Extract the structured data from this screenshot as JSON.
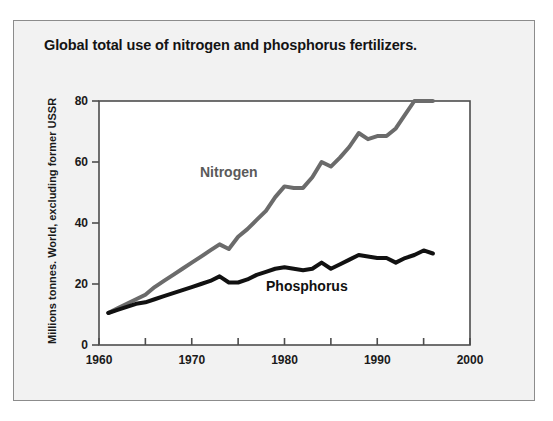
{
  "figure": {
    "title": "Global total use of nitrogen and phosphorus fertilizers.",
    "background_color": "#f2f2f2",
    "border_color": "#8c8c8c",
    "plot_background_color": "#ffffff"
  },
  "chart_data": {
    "type": "line",
    "title": "Global total use of nitrogen and phosphorus fertilizers.",
    "xlabel": "",
    "ylabel": "Millions tonnes. World, excluding former USSR",
    "xlim": [
      1960,
      2000
    ],
    "ylim": [
      0,
      80
    ],
    "xticks": [
      1960,
      1970,
      1980,
      1990,
      2000
    ],
    "xticklabels": [
      "1960",
      "1970",
      "1980",
      "1990",
      "2000"
    ],
    "xminorticks": [
      1965,
      1975,
      1985,
      1995
    ],
    "yticks": [
      0,
      20,
      40,
      60,
      80
    ],
    "yticklabels": [
      "0",
      "20",
      "40",
      "60",
      "80"
    ],
    "grid": false,
    "legend": "inline-annotations",
    "x": [
      1961,
      1962,
      1963,
      1964,
      1965,
      1966,
      1967,
      1968,
      1969,
      1970,
      1971,
      1972,
      1973,
      1974,
      1975,
      1976,
      1977,
      1978,
      1979,
      1980,
      1981,
      1982,
      1983,
      1984,
      1985,
      1986,
      1987,
      1988,
      1989,
      1990,
      1991,
      1992,
      1993,
      1994,
      1995,
      1996
    ],
    "series": [
      {
        "name": "Nitrogen",
        "color": "#6b6b6b",
        "label_color": "#5a5a5a",
        "line_width": 4,
        "values": [
          10.5,
          12.0,
          13.5,
          15.0,
          16.5,
          19.0,
          21.0,
          23.0,
          25.0,
          27.0,
          29.0,
          31.0,
          33.0,
          31.5,
          35.5,
          38.0,
          41.0,
          44.0,
          48.5,
          52.0,
          51.5,
          51.5,
          55.0,
          60.0,
          58.5,
          61.5,
          65.0,
          69.5,
          67.5,
          68.5,
          68.5,
          71.0,
          75.5,
          80.0,
          80.0,
          80.0
        ]
      },
      {
        "name": "Phosphorus",
        "color": "#111111",
        "label_color": "#111111",
        "line_width": 4,
        "values": [
          10.5,
          11.5,
          12.5,
          13.5,
          14.0,
          15.0,
          16.0,
          17.0,
          18.0,
          19.0,
          20.0,
          21.0,
          22.5,
          20.5,
          20.5,
          21.5,
          23.0,
          24.0,
          25.0,
          25.5,
          25.0,
          24.5,
          25.0,
          27.0,
          25.0,
          26.5,
          28.0,
          29.5,
          29.0,
          28.5,
          28.5,
          27.0,
          28.5,
          29.5,
          31.0,
          30.0
        ]
      }
    ],
    "annotations": [
      {
        "text": "Nitrogen",
        "x": 1981,
        "y": 56,
        "color": "#5a5a5a"
      },
      {
        "text": "Phosphorus",
        "x": 1988,
        "y": 18,
        "color": "#111111"
      }
    ]
  },
  "axis": {
    "frame_color": "#4d4d4d",
    "tick_color": "#4d4d4d"
  }
}
